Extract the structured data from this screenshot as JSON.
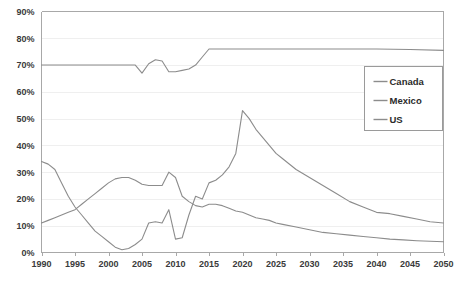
{
  "chart_data": {
    "type": "line",
    "title": "",
    "subtitle": "",
    "xlabel": "",
    "ylabel": "",
    "xlim": [
      1990,
      2050
    ],
    "ylim": [
      0,
      90
    ],
    "grid": true,
    "legend_position": "upper-right",
    "y_ticks": [
      "0%",
      "10%",
      "20%",
      "30%",
      "40%",
      "50%",
      "60%",
      "70%",
      "80%",
      "90%"
    ],
    "y_tick_values": [
      0,
      10,
      20,
      30,
      40,
      50,
      60,
      70,
      80,
      90
    ],
    "x_ticks": [
      "1990",
      "1995",
      "2000",
      "2005",
      "2010",
      "2015",
      "2020",
      "2025",
      "2030",
      "2035",
      "2040",
      "2045",
      "2050"
    ],
    "x_tick_values": [
      1990,
      1995,
      2000,
      2005,
      2010,
      2015,
      2020,
      2025,
      2030,
      2035,
      2040,
      2045,
      2050
    ],
    "series": [
      {
        "name": "Canada",
        "color": "#8c8c8c",
        "x": [
          1990,
          1991,
          1992,
          1993,
          1994,
          1995,
          1996,
          1997,
          1998,
          1999,
          2000,
          2001,
          2002,
          2003,
          2004,
          2005,
          2006,
          2007,
          2008,
          2009,
          2010,
          2011,
          2012,
          2013,
          2014,
          2015,
          2016,
          2017,
          2018,
          2019,
          2020,
          2021,
          2022,
          2023,
          2024,
          2025,
          2026,
          2028,
          2030,
          2032,
          2034,
          2036,
          2038,
          2040,
          2042,
          2044,
          2046,
          2048,
          2050
        ],
        "values": [
          34,
          33,
          31,
          26,
          21,
          17,
          14,
          11,
          8,
          6,
          4,
          2,
          1,
          1.5,
          3,
          5,
          11,
          11.5,
          11,
          16,
          5,
          5.5,
          14,
          21,
          20,
          26,
          27,
          29,
          32,
          37,
          53,
          50,
          46,
          43,
          40,
          37,
          35,
          31,
          28,
          25,
          22,
          19,
          17,
          15,
          14.5,
          13.5,
          12.5,
          11.5,
          11
        ]
      },
      {
        "name": "Mexico",
        "color": "#8c8c8c",
        "x": [
          1990,
          1991,
          1992,
          1993,
          1994,
          1995,
          1996,
          1997,
          1998,
          1999,
          2000,
          2001,
          2002,
          2003,
          2004,
          2005,
          2006,
          2007,
          2008,
          2009,
          2010,
          2011,
          2012,
          2013,
          2014,
          2015,
          2016,
          2017,
          2018,
          2019,
          2020,
          2021,
          2022,
          2023,
          2024,
          2025,
          2026,
          2028,
          2030,
          2032,
          2034,
          2036,
          2038,
          2040,
          2042,
          2044,
          2046,
          2048,
          2050
        ],
        "values": [
          11,
          12,
          13,
          14,
          15,
          16,
          18,
          20,
          22,
          24,
          26,
          27.5,
          28,
          28,
          27,
          25.5,
          25,
          25,
          25,
          30,
          28,
          21,
          19,
          17.5,
          17,
          18,
          18,
          17.5,
          16.5,
          15.5,
          15,
          14,
          13,
          12.5,
          12,
          11,
          10.5,
          9.5,
          8.5,
          7.5,
          7,
          6.5,
          6,
          5.5,
          5,
          4.7,
          4.4,
          4.2,
          4
        ]
      },
      {
        "name": "US",
        "color": "#8c8c8c",
        "x": [
          1990,
          1995,
          2000,
          2003,
          2004,
          2005,
          2006,
          2007,
          2008,
          2009,
          2010,
          2011,
          2012,
          2013,
          2014,
          2015,
          2016,
          2020,
          2025,
          2030,
          2035,
          2040,
          2045,
          2050
        ],
        "values": [
          70,
          70,
          70,
          70,
          70,
          67,
          70.5,
          72,
          71.5,
          67.5,
          67.5,
          68,
          68.5,
          70,
          73,
          76,
          76,
          76,
          76,
          76,
          76,
          76,
          75.8,
          75.5
        ]
      }
    ]
  },
  "legend": {
    "items": [
      {
        "label": "Canada"
      },
      {
        "label": "Mexico"
      },
      {
        "label": "US"
      }
    ]
  }
}
